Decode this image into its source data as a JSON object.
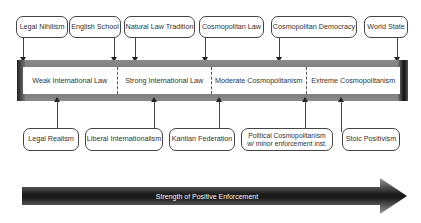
{
  "top_nodes": [
    {
      "label": "Legal Nihilism"
    },
    {
      "label": "English School"
    },
    {
      "label": "Natural Law Tradition"
    },
    {
      "label": "Cosmopolitan Law"
    },
    {
      "label": "Cosmopolitan Democracy"
    },
    {
      "label": "World State"
    }
  ],
  "spectrum": {
    "segments": [
      {
        "label": "Weak International Law"
      },
      {
        "label": "Strong International Law"
      },
      {
        "label": "Moderate Cosmopolitanism"
      },
      {
        "label": "Extreme Cosmopolitanism"
      }
    ]
  },
  "bottom_nodes": [
    {
      "label": "Legal Realism"
    },
    {
      "label": "Liberal Internationalism"
    },
    {
      "label": "Kantian Federation"
    },
    {
      "label": "Political Cosmopolitanism\nw/ minor enforcement inst."
    },
    {
      "label": "Stoic Positivism"
    }
  ],
  "axis_arrow": {
    "label": "Strength of Positive Enforcement"
  },
  "colors": {
    "bar": "#767676",
    "node_border": "#444444",
    "arrow_dark": "#1e1e1e",
    "arrow_light": "#8c8c8c"
  }
}
